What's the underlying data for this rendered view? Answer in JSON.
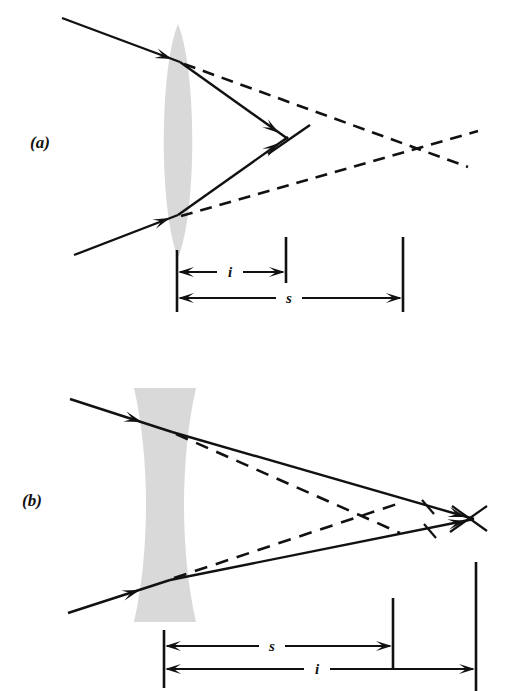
{
  "figure": {
    "kind": "optics-ray-diagram",
    "background_color": "#ffffff",
    "ink_color": "#111111",
    "lens_fill_color": "#d9d9d9",
    "width": 517,
    "height": 691
  },
  "panels": [
    {
      "id": "a",
      "label": "(a)",
      "label_pos": {
        "x": 30,
        "y": 148
      },
      "lens": {
        "name": "converging-lens",
        "type": "biconvex",
        "center_x": 178,
        "top_y": 24,
        "bottom_y": 258,
        "max_half_width": 19
      },
      "dimensions": [
        {
          "name": "image-distance",
          "symbol": "i",
          "label_x": 230,
          "label_y": 277,
          "line_y": 272,
          "from_x": 177,
          "to_x": 286
        },
        {
          "name": "object-distance",
          "symbol": "s",
          "label_x": 289,
          "label_y": 303,
          "line_y": 298,
          "from_x": 177,
          "to_x": 403
        }
      ],
      "ticks": [
        {
          "name": "lens-plane-tick",
          "x": 177,
          "y1": 250,
          "y2": 312
        },
        {
          "name": "image-point-tick",
          "x": 286,
          "y1": 237,
          "y2": 283
        },
        {
          "name": "object-point-tick",
          "x": 403,
          "y1": 237,
          "y2": 312
        }
      ],
      "rays_solid": [
        {
          "name": "upper-incident-ray",
          "x1": 62,
          "y1": 18,
          "x2": 180,
          "y2": 62
        },
        {
          "name": "upper-refracted-ray",
          "x1": 180,
          "y1": 62,
          "x2": 288,
          "y2": 139
        },
        {
          "name": "lower-incident-ray",
          "x1": 74,
          "y1": 255,
          "x2": 178,
          "y2": 215
        },
        {
          "name": "lower-refracted-ray",
          "x1": 178,
          "y1": 215,
          "x2": 288,
          "y2": 137
        },
        {
          "name": "image-cross-stroke",
          "x1": 268,
          "y1": 154,
          "x2": 310,
          "y2": 125
        }
      ],
      "rays_dashed": [
        {
          "name": "upper-virtual-extension",
          "x1": 184,
          "y1": 64,
          "x2": 468,
          "y2": 167
        },
        {
          "name": "lower-virtual-extension",
          "x1": 181,
          "y1": 216,
          "x2": 478,
          "y2": 131
        }
      ],
      "arrowheads": [
        {
          "name": "upper-incident-arrow",
          "x": 172,
          "y": 59,
          "angle": 20
        },
        {
          "name": "lower-incident-arrow",
          "x": 170,
          "y": 218,
          "angle": -21
        },
        {
          "name": "upper-refracted-arrow",
          "x": 279,
          "y": 133,
          "angle": 35
        },
        {
          "name": "lower-refracted-arrow",
          "x": 279,
          "y": 143,
          "angle": -35
        }
      ]
    },
    {
      "id": "b",
      "label": "(b)",
      "label_pos": {
        "x": 22,
        "y": 506
      },
      "lens": {
        "name": "diverging-lens",
        "type": "biconcave",
        "center_x": 165,
        "top_y": 388,
        "bottom_y": 622,
        "max_half_width": 31,
        "waist_half_width": 15
      },
      "dimensions": [
        {
          "name": "object-distance",
          "symbol": "s",
          "label_x": 272,
          "label_y": 651,
          "line_y": 646,
          "from_x": 164,
          "to_x": 393
        },
        {
          "name": "image-distance",
          "symbol": "i",
          "label_x": 317,
          "label_y": 674,
          "line_y": 669,
          "from_x": 164,
          "to_x": 476
        }
      ],
      "ticks": [
        {
          "name": "lens-plane-tick",
          "x": 164,
          "y1": 630,
          "y2": 688
        },
        {
          "name": "object-point-tick",
          "x": 393,
          "y1": 598,
          "y2": 670
        },
        {
          "name": "image-point-tick",
          "x": 476,
          "y1": 562,
          "y2": 691
        }
      ],
      "rays_solid": [
        {
          "name": "upper-incident-ray",
          "x1": 70,
          "y1": 399,
          "x2": 172,
          "y2": 432
        },
        {
          "name": "upper-refracted-ray",
          "x1": 172,
          "y1": 432,
          "x2": 474,
          "y2": 519
        },
        {
          "name": "lower-incident-ray",
          "x1": 68,
          "y1": 613,
          "x2": 170,
          "y2": 580
        },
        {
          "name": "lower-refracted-ray",
          "x1": 170,
          "y1": 580,
          "x2": 474,
          "y2": 519
        },
        {
          "name": "image-cross-stroke-upper",
          "x1": 450,
          "y1": 532,
          "x2": 487,
          "y2": 506
        },
        {
          "name": "image-cross-stroke-lower",
          "x1": 452,
          "y1": 506,
          "x2": 487,
          "y2": 531
        }
      ],
      "rays_dashed": [
        {
          "name": "upper-virtual-extension",
          "x1": 176,
          "y1": 434,
          "x2": 400,
          "y2": 533
        },
        {
          "name": "lower-virtual-extension",
          "x1": 174,
          "y1": 578,
          "x2": 400,
          "y2": 503
        }
      ],
      "arrowheads": [
        {
          "name": "upper-incident-arrow",
          "x": 142,
          "y": 422,
          "angle": 18
        },
        {
          "name": "lower-incident-arrow",
          "x": 140,
          "y": 590,
          "angle": -18
        },
        {
          "name": "upper-refracted-arrow",
          "x": 466,
          "y": 517,
          "angle": 16
        },
        {
          "name": "lower-refracted-arrow",
          "x": 466,
          "y": 521,
          "angle": -11
        }
      ],
      "tick_marks_on_rays": [
        {
          "name": "upper-ray-tick",
          "x": 428,
          "y": 507
        },
        {
          "name": "lower-ray-tick",
          "x": 430,
          "y": 531
        }
      ]
    }
  ],
  "dimension_arrow_legend": {
    "left_arrow_name": "left-arrowhead",
    "right_arrow_name": "right-arrowhead"
  }
}
